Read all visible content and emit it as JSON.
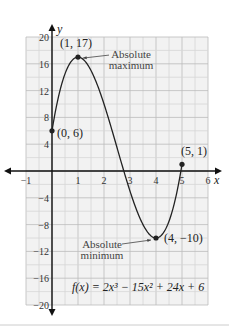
{
  "chart_data": {
    "type": "line",
    "title": "",
    "xlabel": "x",
    "ylabel": "y",
    "xlim": [
      -1,
      6
    ],
    "ylim": [
      -20,
      20
    ],
    "grid": true,
    "x_ticks": [
      -1,
      1,
      2,
      3,
      4,
      5,
      6
    ],
    "x_tick_labels": [
      "−1",
      "1",
      "2",
      "3",
      "4",
      "5",
      "6"
    ],
    "y_ticks": [
      20,
      16,
      12,
      8,
      4,
      -4,
      -8,
      -12,
      -16,
      -20
    ],
    "y_tick_labels": [
      "20",
      "16",
      "12",
      "8",
      "4",
      "−4",
      "−8",
      "−12",
      "−16",
      "−20"
    ],
    "function": "f(x) = 2x^3 - 15x^2 + 24x + 6",
    "function_label": "f(x) = 2x³ − 15x² + 24x + 6",
    "domain": [
      0,
      5
    ],
    "series": [
      {
        "name": "f(x)",
        "x_range": [
          0,
          5
        ],
        "coefficients": [
          2,
          -15,
          24,
          6
        ]
      }
    ],
    "points": [
      {
        "x": 0,
        "y": 6,
        "label": "(0, 6)"
      },
      {
        "x": 1,
        "y": 17,
        "label": "(1, 17)"
      },
      {
        "x": 4,
        "y": -10,
        "label": "(4, −10)"
      },
      {
        "x": 5,
        "y": 1,
        "label": "(5, 1)"
      }
    ],
    "annotations": [
      {
        "text_lines": [
          "Absolute",
          "maximum"
        ],
        "points_to": [
          1,
          17
        ]
      },
      {
        "text_lines": [
          "Absolute",
          "minimum"
        ],
        "points_to": [
          4,
          -10
        ]
      }
    ]
  }
}
